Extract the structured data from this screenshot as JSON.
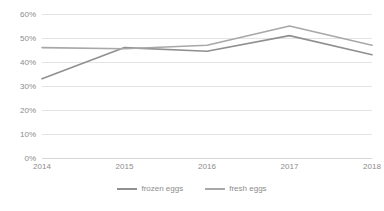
{
  "chart_data": {
    "type": "line",
    "title": "",
    "subtitle": "",
    "xlabel": "",
    "ylabel": "",
    "categories": [
      "2014",
      "2015",
      "2016",
      "2017",
      "2018"
    ],
    "x": [
      2014,
      2015,
      2016,
      2017,
      2018
    ],
    "series": [
      {
        "name": "frozen eggs",
        "color": "#909090",
        "values": [
          33,
          46,
          44.5,
          51,
          43
        ]
      },
      {
        "name": "fresh eggs",
        "color": "#a8a8a8",
        "values": [
          46,
          45.5,
          47,
          55,
          47
        ]
      }
    ],
    "ylim": [
      0,
      60
    ],
    "yticks": [
      0,
      10,
      20,
      30,
      40,
      50,
      60
    ],
    "ytick_labels": [
      "0%",
      "10%",
      "20%",
      "30%",
      "40%",
      "50%",
      "60%"
    ],
    "xtick_labels": [
      "2014",
      "2015",
      "2016",
      "2017",
      "2018"
    ],
    "grid": true,
    "grid_axis": "y",
    "legend_position": "bottom",
    "value_format": "percent"
  },
  "legend": {
    "items": [
      {
        "label": "frozen eggs"
      },
      {
        "label": "fresh eggs"
      }
    ]
  }
}
